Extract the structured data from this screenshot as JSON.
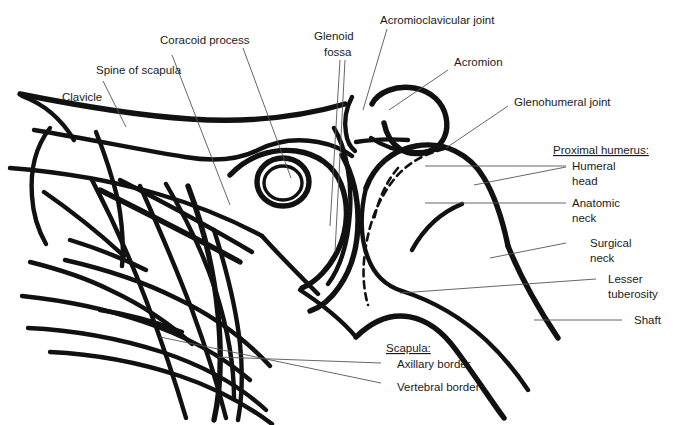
{
  "figure": {
    "background_color": "#ffffff",
    "bone_line_color": "#111111",
    "leader_line_color": "#55555a",
    "text_color": "#1a1a1a"
  },
  "labels": {
    "clavicle": "Clavicle",
    "spine_of_scapula": "Spine of scapula",
    "coracoid_process": "Coracoid process",
    "glenoid_fossa_line1": "Glenoid",
    "glenoid_fossa_line2": "fossa",
    "acromioclavicular_joint": "Acromioclavicular joint",
    "acromion": "Acromion",
    "glenohumeral_joint": "Glenohumeral joint",
    "proximal_humerus_heading": "Proximal humerus:",
    "humeral_head_line1": "Humeral",
    "humeral_head_line2": "head",
    "anatomic_neck_line1": "Anatomic",
    "anatomic_neck_line2": "neck",
    "surgical_neck_line1": "Surgical",
    "surgical_neck_line2": "neck",
    "lesser_tuberosity_line1": "Lesser",
    "lesser_tuberosity_line2": "tuberosity",
    "shaft": "Shaft",
    "scapula_heading": "Scapula:",
    "axillary_border": "Axillary border",
    "vertebral_border": "Vertebral border"
  }
}
